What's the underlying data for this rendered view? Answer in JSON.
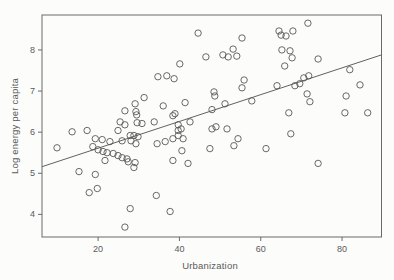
{
  "figure": {
    "background": "#fcfcfa",
    "frame_color": "#6a6a6a",
    "tick_color": "#6a6a6a",
    "text_color": "#5a5a5a",
    "point_color": "#585858",
    "line_color": "#4f4f4f"
  },
  "chart_data": {
    "type": "scatter",
    "title": "",
    "xlabel": "Urbanization",
    "ylabel": "Log energy per capita",
    "xlim": [
      6.2,
      89.7
    ],
    "ylim": [
      3.45,
      8.85
    ],
    "x_ticks": [
      20,
      40,
      60,
      80
    ],
    "y_ticks": [
      4,
      5,
      6,
      7,
      8
    ],
    "grid": false,
    "legend": "none",
    "marker": "open-circle",
    "regression_line": {
      "x1": 6.2,
      "y1": 5.16,
      "x2": 89.7,
      "y2": 7.88
    },
    "points": [
      [
        44.6,
        8.41
      ],
      [
        55.4,
        8.29
      ],
      [
        53.2,
        8.02
      ],
      [
        50.7,
        7.88
      ],
      [
        52.0,
        7.83
      ],
      [
        54.1,
        7.85
      ],
      [
        46.5,
        7.83
      ],
      [
        40.1,
        7.66
      ],
      [
        34.7,
        7.35
      ],
      [
        36.9,
        7.37
      ],
      [
        38.7,
        7.3
      ],
      [
        55.9,
        7.27
      ],
      [
        55.4,
        7.08
      ],
      [
        71.6,
        8.65
      ],
      [
        64.5,
        8.46
      ],
      [
        65.0,
        8.36
      ],
      [
        66.2,
        8.34
      ],
      [
        67.9,
        8.46
      ],
      [
        65.2,
        8.0
      ],
      [
        67.2,
        7.98
      ],
      [
        67.7,
        7.81
      ],
      [
        74.1,
        7.78
      ],
      [
        65.9,
        7.61
      ],
      [
        81.9,
        7.52
      ],
      [
        71.8,
        7.37
      ],
      [
        70.6,
        7.32
      ],
      [
        48.5,
        6.98
      ],
      [
        48.7,
        6.88
      ],
      [
        57.8,
        6.76
      ],
      [
        41.4,
        6.72
      ],
      [
        36.0,
        6.64
      ],
      [
        48.0,
        6.55
      ],
      [
        51.2,
        6.69
      ],
      [
        38.9,
        6.45
      ],
      [
        26.6,
        6.52
      ],
      [
        29.1,
        6.69
      ],
      [
        31.3,
        6.84
      ],
      [
        29.3,
        6.5
      ],
      [
        29.5,
        6.42
      ],
      [
        69.6,
        7.18
      ],
      [
        64.0,
        7.13
      ],
      [
        68.4,
        7.13
      ],
      [
        71.4,
        6.93
      ],
      [
        72.1,
        6.74
      ],
      [
        84.4,
        7.15
      ],
      [
        81.0,
        6.88
      ],
      [
        66.9,
        6.47
      ],
      [
        80.7,
        6.47
      ],
      [
        86.3,
        6.47
      ],
      [
        42.6,
        6.25
      ],
      [
        26.6,
        6.18
      ],
      [
        29.6,
        6.23
      ],
      [
        30.8,
        6.21
      ],
      [
        25.4,
        6.25
      ],
      [
        33.8,
        6.25
      ],
      [
        38.4,
        6.4
      ],
      [
        39.7,
        6.18
      ],
      [
        13.6,
        6.01
      ],
      [
        17.3,
        6.04
      ],
      [
        24.9,
        6.04
      ],
      [
        48.0,
        6.08
      ],
      [
        49.0,
        6.13
      ],
      [
        51.7,
        6.08
      ],
      [
        39.7,
        6.04
      ],
      [
        40.4,
        6.08
      ],
      [
        19.3,
        5.84
      ],
      [
        18.7,
        5.65
      ],
      [
        9.9,
        5.62
      ],
      [
        27.9,
        5.92
      ],
      [
        28.8,
        5.92
      ],
      [
        29.8,
        5.89
      ],
      [
        28.1,
        5.79
      ],
      [
        29.3,
        5.72
      ],
      [
        25.9,
        5.79
      ],
      [
        21.0,
        5.82
      ],
      [
        22.9,
        5.77
      ],
      [
        20.0,
        5.57
      ],
      [
        21.2,
        5.53
      ],
      [
        22.2,
        5.5
      ],
      [
        23.7,
        5.48
      ],
      [
        24.9,
        5.43
      ],
      [
        25.9,
        5.38
      ],
      [
        21.7,
        5.31
      ],
      [
        27.1,
        5.35
      ],
      [
        27.4,
        5.28
      ],
      [
        29.1,
        5.26
      ],
      [
        34.5,
        5.72
      ],
      [
        36.5,
        5.77
      ],
      [
        38.4,
        5.84
      ],
      [
        39.7,
        5.92
      ],
      [
        40.9,
        5.84
      ],
      [
        54.4,
        5.84
      ],
      [
        53.4,
        5.67
      ],
      [
        47.5,
        5.6
      ],
      [
        40.6,
        5.55
      ],
      [
        61.3,
        5.6
      ],
      [
        67.4,
        5.96
      ],
      [
        15.3,
        5.04
      ],
      [
        19.3,
        4.97
      ],
      [
        17.8,
        4.53
      ],
      [
        19.8,
        4.63
      ],
      [
        28.8,
        5.14
      ],
      [
        38.4,
        5.31
      ],
      [
        42.1,
        5.24
      ],
      [
        74.1,
        5.24
      ],
      [
        34.3,
        4.46
      ],
      [
        37.7,
        4.07
      ],
      [
        27.9,
        4.14
      ],
      [
        26.6,
        3.69
      ]
    ]
  }
}
